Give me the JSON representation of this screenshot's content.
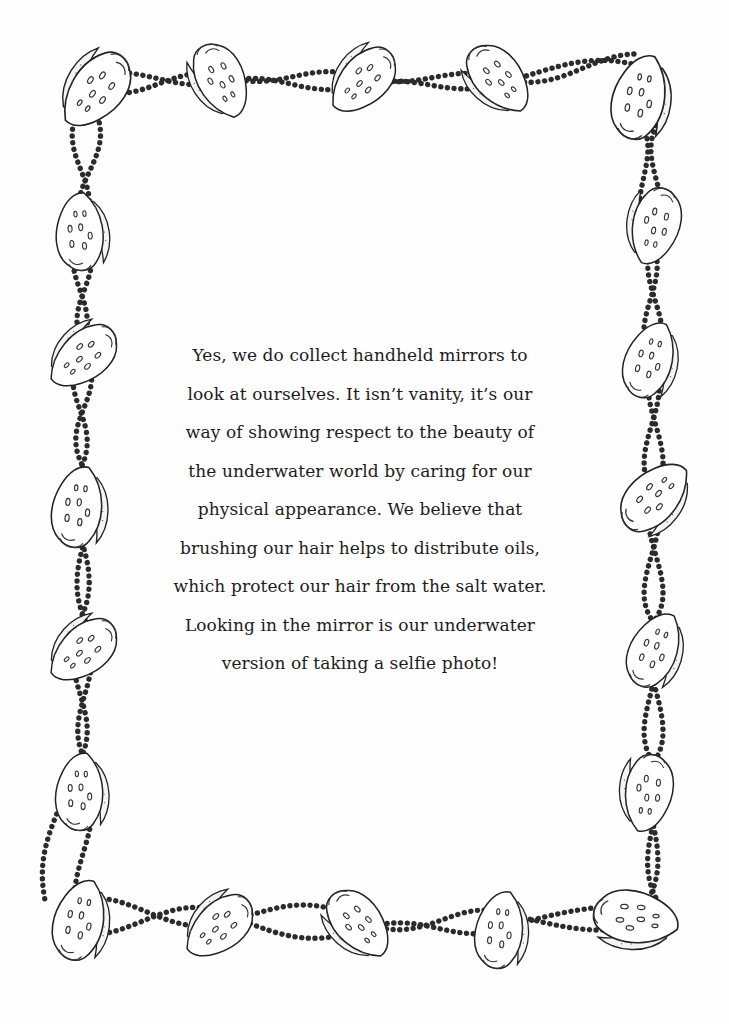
{
  "page": {
    "background": "#ffffff",
    "ink_color": "#1c1c1c",
    "border": {
      "style": "seashells-and-bead-strands",
      "icons": {
        "shell": "seashell-icon",
        "beads": "bead-strand-icon"
      },
      "shell_count": 21
    },
    "paragraph": {
      "lines": [
        "Yes, we do collect handheld mirrors to",
        "look at ourselves. It isn’t vanity, it’s our",
        "way of showing respect to the beauty of",
        "the underwater world by caring for our",
        "physical appearance. We believe that",
        "brushing our hair helps to distribute oils,",
        "which protect our hair from the salt water.",
        "Looking in the mirror is our underwater",
        "version of taking a selfie photo!"
      ]
    }
  }
}
